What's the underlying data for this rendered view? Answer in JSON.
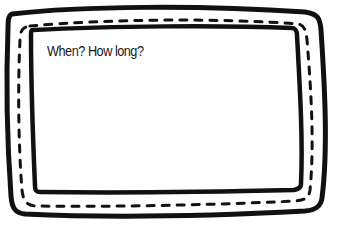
{
  "frame": {
    "prompt": "When? How long?",
    "stroke_color": "#111111",
    "fill_color": "#ffffff"
  }
}
